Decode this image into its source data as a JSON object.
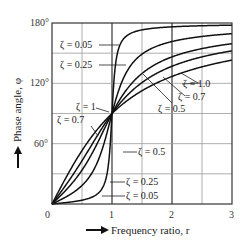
{
  "chart_data": {
    "type": "line",
    "title": "",
    "xlabel": "Frequency ratio, r",
    "ylabel": "Phase angle, φ",
    "xlim": [
      0,
      3
    ],
    "ylim": [
      0,
      180
    ],
    "x_ticks": [
      "0",
      "1",
      "2",
      "3"
    ],
    "y_ticks": [
      "60°",
      "120°",
      "180°"
    ],
    "grid": true,
    "x_grid_step": 0.5,
    "y_grid_step": 30,
    "legend_position": "inline leader-line labels",
    "formula": "φ = atan2(2ζr, 1 − r²)",
    "x": [
      0,
      0.1,
      0.2,
      0.3,
      0.4,
      0.5,
      0.6,
      0.7,
      0.8,
      0.9,
      0.95,
      1.0,
      1.05,
      1.1,
      1.2,
      1.3,
      1.4,
      1.5,
      1.6,
      1.8,
      2.0,
      2.2,
      2.4,
      2.6,
      2.8,
      3.0
    ],
    "series": [
      {
        "name": "ζ = 0.05",
        "values": [
          0,
          0.6,
          1.2,
          1.9,
          2.7,
          3.8,
          5.4,
          7.8,
          12.5,
          25.3,
          44.3,
          90,
          135.2,
          152.4,
          164.7,
          169.0,
          171.7,
          173.2,
          174.3,
          175.9,
          176.7,
          177.3,
          177.7,
          178.0,
          178.2,
          178.4
        ]
      },
      {
        "name": "ζ = 0.25",
        "values": [
          0,
          2.9,
          6.0,
          9.4,
          13.4,
          18.4,
          25.1,
          34.5,
          48.0,
          67.1,
          78.4,
          90,
          100.8,
          110.5,
          126.0,
          136.9,
          144.6,
          149.1,
          152.7,
          158.1,
          161.6,
          163.9,
          165.7,
          167.1,
          168.2,
          169.4
        ]
      },
      {
        "name": "ζ = 0.5",
        "values": [
          0,
          5.8,
          11.8,
          18.3,
          25.5,
          33.7,
          43.2,
          53.9,
          65.8,
          78.1,
          84.0,
          90,
          95.9,
          100.5,
          110.8,
          119.5,
          126.6,
          129.8,
          135.8,
          143.1,
          146.3,
          149.5,
          152.4,
          154.9,
          157.0,
          159.4
        ]
      },
      {
        "name": "ζ = 0.7",
        "values": [
          0,
          8.1,
          16.3,
          24.8,
          33.7,
          43.0,
          52.7,
          62.5,
          72.0,
          81.0,
          85.8,
          90,
          94.1,
          98.0,
          104.8,
          111.0,
          116.3,
          120.8,
          124.6,
          130.5,
          136.1,
          139.6,
          142.5,
          145.0,
          147.0,
          149.7
        ]
      },
      {
        "name": "ζ = 1.0",
        "values": [
          0,
          11.4,
          22.6,
          33.4,
          43.6,
          53.1,
          61.9,
          69.9,
          77.3,
          84.0,
          87.1,
          90,
          92.9,
          95.5,
          100.4,
          104.8,
          108.9,
          112.6,
          115.9,
          121.8,
          126.9,
          131.4,
          135.2,
          138.5,
          141.3,
          143.1
        ]
      }
    ],
    "annotations": [
      {
        "text": "ζ = 0.05",
        "side": "upper-left"
      },
      {
        "text": "ζ = 0.25",
        "side": "upper-left"
      },
      {
        "text": "ζ = 1",
        "side": "middle-left"
      },
      {
        "text": "ζ = 0.7",
        "side": "middle-left"
      },
      {
        "text": "ζ = 1.0",
        "side": "upper-right"
      },
      {
        "text": "ζ = 0.7",
        "side": "upper-right"
      },
      {
        "text": "ζ = 0.5",
        "side": "upper-right"
      },
      {
        "text": "ζ = 0.5",
        "side": "lower-right"
      },
      {
        "text": "ζ = 0.25",
        "side": "lower-right"
      },
      {
        "text": "ζ = 0.05",
        "side": "lower-right"
      }
    ]
  },
  "labels": {
    "y0": "0",
    "x1": "1",
    "x2": "2",
    "x3": "3",
    "y60": "60°",
    "y120": "120°",
    "y180": "180°",
    "xaxis": "Frequency ratio, r",
    "yaxis": "Phase angle, φ",
    "a_005_top": "ζ = 0.05",
    "a_025_top": "ζ = 0.25",
    "a_1_mid": "ζ = 1",
    "a_07_mid": "ζ = 0.7",
    "a_10_right": "ζ = 1.0",
    "a_07_right": "ζ = 0.7",
    "a_05_right": "ζ = 0.5",
    "a_05_low": "ζ = 0.5",
    "a_025_low": "ζ = 0.25",
    "a_005_low": "ζ = 0.05"
  }
}
